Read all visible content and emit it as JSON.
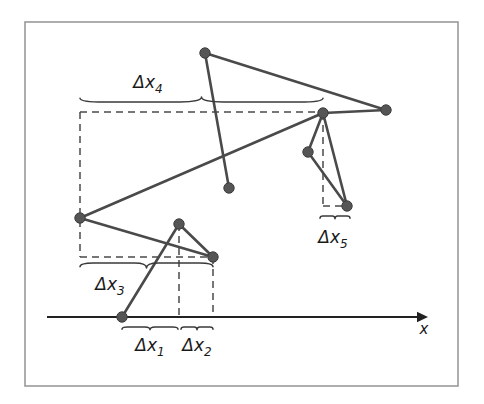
{
  "figure": {
    "frame": {
      "x": 25,
      "y": 22,
      "width": 433,
      "height": 364,
      "stroke": "#9a9a9a"
    },
    "colors": {
      "node_fill": "#555555",
      "node_stroke": "#3d3d3d",
      "segment": "#4a4a4a",
      "axis": "#222222",
      "dashed": "#4a4a4a",
      "brace": "#3a3a3a",
      "text": "#1a1a1a",
      "background": "#ffffff"
    },
    "axis": {
      "name": "x-axis",
      "label": "x",
      "label_x": 424,
      "label_y": 334,
      "y": 317,
      "x_start": 47,
      "x_end": 428
    },
    "nodes": [
      {
        "id": "n1",
        "name": "node-axis-origin-point",
        "x": 122,
        "y": 317
      },
      {
        "id": "n2",
        "name": "node-lower-peak",
        "x": 179,
        "y": 224
      },
      {
        "id": "n3",
        "name": "node-lower-right",
        "x": 213,
        "y": 257
      },
      {
        "id": "n4",
        "name": "node-left-vertex",
        "x": 80,
        "y": 218
      },
      {
        "id": "n5",
        "name": "node-top-left-apex",
        "x": 205,
        "y": 53
      },
      {
        "id": "n6",
        "name": "node-mid-lower",
        "x": 229,
        "y": 188
      },
      {
        "id": "n7",
        "name": "node-upper-right-junction",
        "x": 323,
        "y": 113
      },
      {
        "id": "n8",
        "name": "node-far-right-apex",
        "x": 386,
        "y": 110
      },
      {
        "id": "n9",
        "name": "node-right-middle",
        "x": 308,
        "y": 152
      },
      {
        "id": "n10",
        "name": "node-right-bottom",
        "x": 347,
        "y": 206
      }
    ],
    "segments": [
      {
        "name": "segment-axis-to-peak",
        "from": "n1",
        "to": "n2"
      },
      {
        "name": "segment-peak-to-lowerright",
        "from": "n2",
        "to": "n3"
      },
      {
        "name": "segment-left-to-lowerright",
        "from": "n4",
        "to": "n3"
      },
      {
        "name": "segment-left-to-junction",
        "from": "n4",
        "to": "n7"
      },
      {
        "name": "segment-apex-to-midlower",
        "from": "n5",
        "to": "n6"
      },
      {
        "name": "segment-apex-to-farright",
        "from": "n5",
        "to": "n8"
      },
      {
        "name": "segment-farright-to-junction",
        "from": "n8",
        "to": "n7"
      },
      {
        "name": "segment-junction-to-rightbottom",
        "from": "n7",
        "to": "n10"
      },
      {
        "name": "segment-rightmiddle-to-rightbottom",
        "from": "n9",
        "to": "n10"
      },
      {
        "name": "segment-junction-to-rightmiddle",
        "from": "n7",
        "to": "n9"
      }
    ],
    "dashed_guides": [
      {
        "name": "dashed-vertical-left-box",
        "x1": 80,
        "y1": 112,
        "x2": 80,
        "y2": 257
      },
      {
        "name": "dashed-horizontal-top-box",
        "x1": 80,
        "y1": 112,
        "x2": 323,
        "y2": 112
      },
      {
        "name": "dashed-horizontal-bottom-box",
        "x1": 80,
        "y1": 257,
        "x2": 213,
        "y2": 257
      },
      {
        "name": "dashed-vertical-peak-drop",
        "x1": 179,
        "y1": 224,
        "x2": 179,
        "y2": 317
      },
      {
        "name": "dashed-vertical-lowerright-drop",
        "x1": 213,
        "y1": 257,
        "x2": 213,
        "y2": 317
      },
      {
        "name": "dashed-vertical-junction-drop",
        "x1": 323,
        "y1": 113,
        "x2": 323,
        "y2": 206
      },
      {
        "name": "dashed-horizontal-rightbottom",
        "x1": 323,
        "y1": 206,
        "x2": 347,
        "y2": 206
      }
    ],
    "braces": [
      {
        "id": "dx1",
        "name": "brace-delta-x1",
        "x_start": 122,
        "x_end": 178,
        "y": 327,
        "direction": "down",
        "label": "Δx",
        "subscript": "1",
        "label_x": 150,
        "label_y": 351
      },
      {
        "id": "dx2",
        "name": "brace-delta-x2",
        "x_start": 181,
        "x_end": 213,
        "y": 327,
        "direction": "down",
        "label": "Δx",
        "subscript": "2",
        "label_x": 197,
        "label_y": 351
      },
      {
        "id": "dx3",
        "name": "brace-delta-x3",
        "x_start": 80,
        "x_end": 213,
        "y": 263,
        "direction": "down",
        "label": "Δx",
        "subscript": "3",
        "label_x": 110,
        "label_y": 290
      },
      {
        "id": "dx4",
        "name": "brace-delta-x4",
        "x_start": 80,
        "x_end": 323,
        "y": 102,
        "direction": "up",
        "label": "Δx",
        "subscript": "4",
        "label_x": 148,
        "label_y": 88
      },
      {
        "id": "dx5",
        "name": "brace-delta-x5",
        "x_start": 320,
        "x_end": 350,
        "y": 216,
        "direction": "down",
        "label": "Δx",
        "subscript": "5",
        "label_x": 333,
        "label_y": 243
      }
    ]
  }
}
